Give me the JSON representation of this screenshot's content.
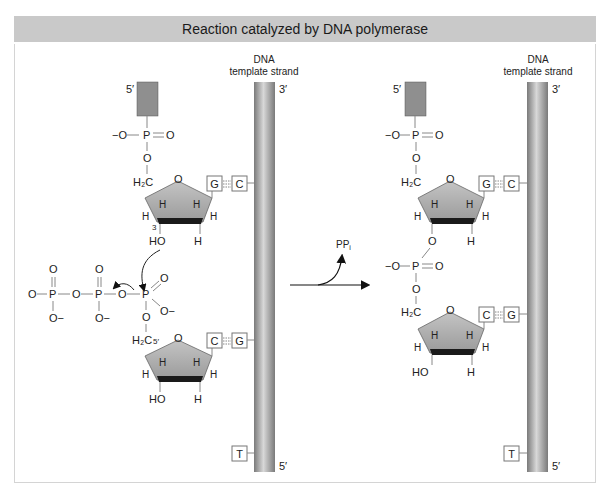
{
  "header": {
    "title": "Reaction catalyzed by DNA polymerase"
  },
  "left": {
    "strand_label_line1": "DNA",
    "strand_label_line2": "template strand",
    "strand_top_end": "3′",
    "strand_bottom_end": "5′",
    "primer_end": "5′",
    "phosphate_top": {
      "o_minus": "−O",
      "p": "P",
      "o_double": "O",
      "o_link": "O"
    },
    "ch2": "H₂C",
    "ring_o": "O",
    "sugar1_h": [
      "H",
      "H",
      "H",
      "H"
    ],
    "sugar1_3prime": "3",
    "sugar1_oh": "HO",
    "sugar1_h_bottom": "H",
    "base_pair1": {
      "primer_base": "G",
      "template_base": "C"
    },
    "pyrophosphate": {
      "o1": "O",
      "p1": "P",
      "o_bridge": "O",
      "p2": "P",
      "o_top1": "O",
      "o_top2": "O",
      "o_minus1": "O−",
      "o_minus2": "O−",
      "o_leaving": "O"
    },
    "incoming_phosphate": {
      "p": "P",
      "o_double": "O",
      "o_minus": "O−",
      "o_link": "O"
    },
    "ch2_2": "H₂C",
    "five_prime": "5′",
    "base_pair2": {
      "primer_base": "C",
      "template_base": "G"
    },
    "sugar2_h": [
      "H",
      "H",
      "H",
      "H"
    ],
    "sugar2_oh": "HO",
    "sugar2_h_bottom": "H",
    "template_next_base": "T"
  },
  "arrow": {
    "byproduct": "PP",
    "byproduct_sub": "i"
  },
  "right": {
    "strand_label_line1": "DNA",
    "strand_label_line2": "template strand",
    "strand_top_end": "3′",
    "strand_bottom_end": "5′",
    "primer_end": "5′",
    "base_pair1": {
      "primer_base": "G",
      "template_base": "C"
    },
    "base_pair2": {
      "primer_base": "C",
      "template_base": "G"
    },
    "template_next_base": "T",
    "oh": "HO",
    "h": "H"
  },
  "colors": {
    "header_bg": "#c9c9c9",
    "sugar_fill": "#a8a8a8",
    "sugar_bottom": "#1a1a1a",
    "primer_block": "#8f8f8f",
    "strand": "#9a9a9a"
  }
}
